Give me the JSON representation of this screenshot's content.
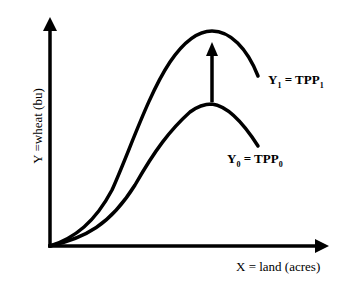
{
  "diagram": {
    "type": "total physical product curves",
    "y_axis_label": "Y =wheat (bu)",
    "x_axis_label": "X = land (acres)",
    "curves": [
      {
        "id": "upper",
        "label_main": "Y",
        "label_sub": "1",
        "label_eq": " = TPP",
        "label_eq_sub": "1"
      },
      {
        "id": "lower",
        "label_main": "Y",
        "label_sub": "0",
        "label_eq": " = TPP",
        "label_eq_sub": "0"
      }
    ],
    "shift_arrow": "upward shift from TPP0 to TPP1",
    "colors": {
      "line": "#000000",
      "background": "#ffffff"
    }
  }
}
